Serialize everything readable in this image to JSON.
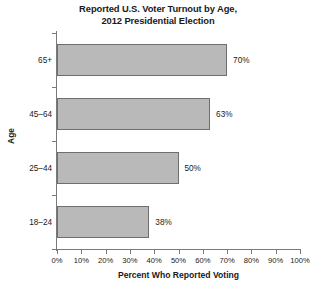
{
  "chart_data": {
    "type": "bar",
    "orientation": "horizontal",
    "title": "Reported U.S. Voter Turnout by Age, 2012 Presidential Election",
    "title_line1": "Reported U.S. Voter Turnout by Age,",
    "title_line2": "2012 Presidential Election",
    "xlabel": "Percent Who Reported Voting",
    "ylabel": "Age",
    "categories": [
      "18–24",
      "25–44",
      "45–64",
      "65+"
    ],
    "values": [
      38,
      50,
      63,
      70
    ],
    "data_labels": [
      "38%",
      "50%",
      "63%",
      "70%"
    ],
    "xlim": [
      0,
      100
    ],
    "xticks": [
      0,
      10,
      20,
      30,
      40,
      50,
      60,
      70,
      80,
      90,
      100
    ],
    "xtick_labels": [
      "0%",
      "10%",
      "20%",
      "30%",
      "40%",
      "50%",
      "60%",
      "70%",
      "80%",
      "90%",
      "100%"
    ],
    "grid": false,
    "legend": false,
    "bar_color": "#b9b9b9",
    "bar_border_color": "#6e6e6e",
    "axis_color": "#7a7a7a",
    "background": "#ffffff"
  }
}
